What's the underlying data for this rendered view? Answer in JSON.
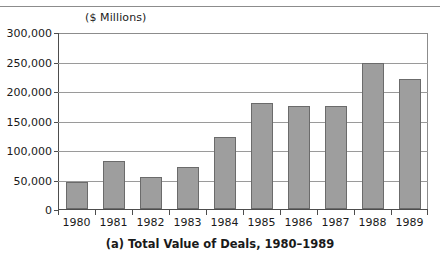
{
  "chart_data": {
    "type": "bar",
    "title": "",
    "caption": "(a) Total Value of Deals, 1980–1989",
    "units_label": "($ Millions)",
    "xlabel": "",
    "ylabel": "",
    "categories": [
      "1980",
      "1981",
      "1982",
      "1983",
      "1984",
      "1985",
      "1986",
      "1987",
      "1988",
      "1989"
    ],
    "values": [
      45000,
      82000,
      54000,
      71000,
      122000,
      180000,
      174000,
      174000,
      248000,
      221000
    ],
    "ytick_labels": [
      "0",
      "50,000",
      "100,000",
      "150,000",
      "200,000",
      "250,000",
      "300,000"
    ],
    "ytick_values": [
      0,
      50000,
      100000,
      150000,
      200000,
      250000,
      300000
    ],
    "ylim": [
      0,
      300000
    ],
    "grid": true,
    "legend": null,
    "legend_position": "none",
    "series": [
      {
        "name": "Total Value of Deals",
        "values": [
          45000,
          82000,
          54000,
          71000,
          122000,
          180000,
          174000,
          174000,
          248000,
          221000
        ]
      }
    ],
    "colors": {
      "bar_fill": "#9e9e9e",
      "bar_border": "#6b6b6b",
      "gridline": "#9a9a9a",
      "axis": "#4d4d4d",
      "text": "#1a1a1a",
      "background": "#ffffff"
    }
  }
}
